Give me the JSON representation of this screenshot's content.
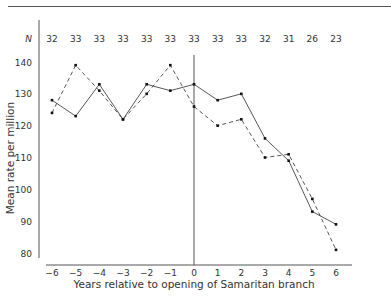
{
  "header": {
    "fragment": "g"
  },
  "chart_data": {
    "type": "line",
    "title": "",
    "xlabel": "Years relative to opening of Samaritan branch",
    "ylabel": "Mean rate per million",
    "x": [
      -6,
      -5,
      -4,
      -3,
      -2,
      -1,
      0,
      1,
      2,
      3,
      4,
      5,
      6
    ],
    "x_tick_labels": [
      "−6",
      "−5",
      "−4",
      "−3",
      "−2",
      "−1",
      "0",
      "1",
      "2",
      "3",
      "4",
      "5",
      "6"
    ],
    "y_ticks": [
      80,
      90,
      100,
      110,
      120,
      130,
      140
    ],
    "ylim": [
      78,
      150
    ],
    "xlim": [
      -6.5,
      6.5
    ],
    "n_label": "N",
    "n_values": [
      32,
      33,
      33,
      33,
      33,
      33,
      33,
      33,
      33,
      32,
      31,
      26,
      23
    ],
    "vertical_reference_x": 0,
    "grid": false,
    "legend": null,
    "series": [
      {
        "name": "solid",
        "style": "solid",
        "values": [
          128,
          123,
          133,
          122,
          133,
          131,
          133,
          128,
          130,
          116,
          109,
          93,
          89
        ]
      },
      {
        "name": "dashed",
        "style": "dashed",
        "values": [
          124,
          139,
          131,
          122,
          130,
          139,
          126,
          120,
          122,
          110,
          111,
          97,
          81
        ]
      }
    ]
  }
}
